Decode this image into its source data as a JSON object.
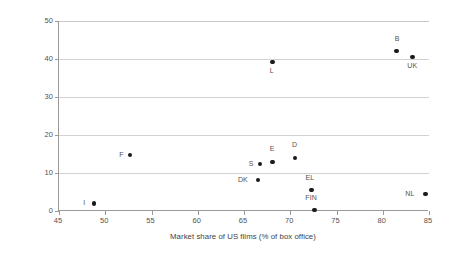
{
  "chart_data": {
    "type": "scatter",
    "title": "",
    "xlabel": "Market share of US films (% of box office)",
    "ylabel": "Density of multiplexes (% of total screens)",
    "xlim": [
      45,
      85
    ],
    "ylim": [
      0,
      50
    ],
    "xticks": [
      45,
      50,
      55,
      60,
      65,
      70,
      75,
      80,
      85
    ],
    "yticks": [
      0,
      10,
      20,
      30,
      40,
      50
    ],
    "grid": "horizontal",
    "legend": "none",
    "marker_color": "#1a1a1a",
    "gridline_color": "#d2d2d2",
    "axis_color": "#9a9a9a",
    "points": [
      {
        "label": "I",
        "x": 48.8,
        "y": 2.0,
        "label_dx": -11,
        "label_dy": -4
      },
      {
        "label": "F",
        "x": 52.7,
        "y": 14.8,
        "label_dx": -11,
        "label_dy": -4
      },
      {
        "label": "DK",
        "x": 66.5,
        "y": 8.2,
        "label_dx": -20,
        "label_dy": -4
      },
      {
        "label": "S",
        "x": 66.7,
        "y": 12.4,
        "label_dx": -11,
        "label_dy": -4
      },
      {
        "label": "E",
        "x": 68.1,
        "y": 12.9,
        "label_dx": -3,
        "label_dy": -17
      },
      {
        "label": "L",
        "x": 68.1,
        "y": 39.2,
        "label_dx": -3,
        "label_dy": 5
      },
      {
        "label": "D",
        "x": 70.5,
        "y": 14.0,
        "label_dx": -3,
        "label_dy": -17
      },
      {
        "label": "EL",
        "x": 72.3,
        "y": 5.5,
        "label_dx": -6,
        "label_dy": -16
      },
      {
        "label": "FIN",
        "x": 72.6,
        "y": 0.3,
        "label_dx": -9,
        "label_dy": -16
      },
      {
        "label": "B",
        "x": 81.5,
        "y": 42.1,
        "label_dx": -2,
        "label_dy": -16
      },
      {
        "label": "UK",
        "x": 83.2,
        "y": 40.5,
        "label_dx": -5,
        "label_dy": 5
      },
      {
        "label": "NL",
        "x": 84.6,
        "y": 4.5,
        "label_dx": -20,
        "label_dy": -4
      }
    ]
  },
  "axes": {
    "y_tick_labels": [
      "0",
      "10",
      "20",
      "30",
      "40",
      "50"
    ],
    "x_tick_labels": [
      "45",
      "50",
      "55",
      "60",
      "65",
      "70",
      "75",
      "80",
      "85"
    ],
    "y_title": "Density of multiplexes (% of total screens)",
    "x_title": "Market share of US films (% of box office)"
  }
}
